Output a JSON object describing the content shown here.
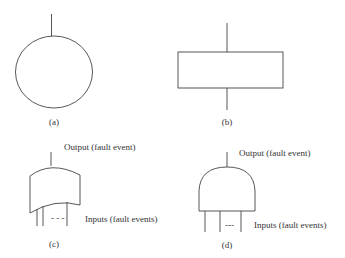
{
  "figure": {
    "panels": [
      {
        "id": "a",
        "label": "(a)",
        "shape": "circle"
      },
      {
        "id": "b",
        "label": "(b)",
        "shape": "rectangle"
      },
      {
        "id": "c",
        "label": "(c)",
        "shape": "or-gate",
        "output_label": "Output (fault event)",
        "inputs_label": "Inputs (fault events)",
        "dots": "- - -"
      },
      {
        "id": "d",
        "label": "(d)",
        "shape": "and-gate",
        "output_label": "Output (fault event)",
        "inputs_label": "Inputs (fault events)",
        "dots": "---"
      }
    ]
  }
}
